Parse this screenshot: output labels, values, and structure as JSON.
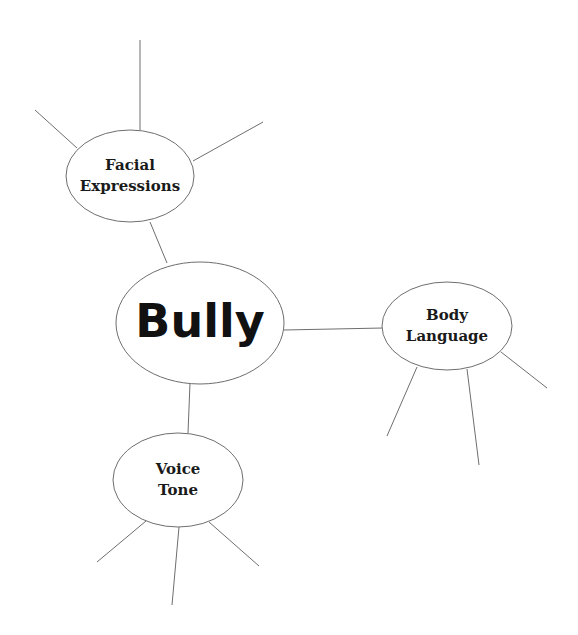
{
  "diagram": {
    "type": "concept-map",
    "colors": {
      "line": "#6e6e6e",
      "text": "#111111",
      "fill": "#ffffff"
    },
    "center": {
      "label": "Bully",
      "cx": 200,
      "cy": 323,
      "rx": 84,
      "ry": 61
    },
    "nodes": [
      {
        "id": "facial-expressions",
        "lines": [
          "Facial",
          "Expressions"
        ],
        "cx": 130,
        "cy": 176,
        "rx": 64,
        "ry": 46,
        "connector": [
          150,
          222,
          167,
          263
        ],
        "spokes": [
          [
            140,
            40,
            140,
            130
          ],
          [
            35,
            110,
            77,
            148
          ],
          [
            193,
            161,
            263,
            122
          ]
        ]
      },
      {
        "id": "body-language",
        "lines": [
          "Body",
          "Language"
        ],
        "cx": 447,
        "cy": 326,
        "rx": 65,
        "ry": 44,
        "connector": [
          284,
          330,
          383,
          328
        ],
        "spokes": [
          [
            417,
            367,
            387,
            436
          ],
          [
            467,
            369,
            479,
            465
          ],
          [
            501,
            352,
            547,
            388
          ]
        ]
      },
      {
        "id": "voice-tone",
        "lines": [
          "Voice",
          "Tone"
        ],
        "cx": 178,
        "cy": 480,
        "rx": 65,
        "ry": 47,
        "connector": [
          190,
          383,
          188,
          433
        ],
        "spokes": [
          [
            146,
            521,
            97,
            562
          ],
          [
            179,
            527,
            172,
            605
          ],
          [
            209,
            522,
            259,
            566
          ]
        ]
      }
    ]
  }
}
